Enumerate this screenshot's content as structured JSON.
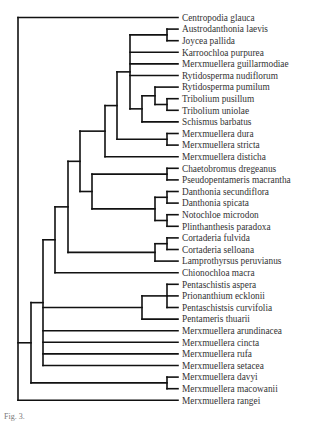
{
  "figure": {
    "type": "phylogenetic-tree",
    "caption_fragment": "Fig. 3.",
    "leaves": [
      "Centropodia glauca",
      "Austrodanthonia laevis",
      "Joycea pallida",
      "Karroochloa purpurea",
      "Merxmuellera guillarmodiae",
      "Rytidosperma nudiflorum",
      "Rytidosperma pumilum",
      "Tribolium pusillum",
      "Tribolium uniolae",
      "Schismus barbatus",
      "Merxmuellera dura",
      "Merxmuellera stricta",
      "Merxmuellera disticha",
      "Chaetobromus dregeanus",
      "Pseudopentameris macrantha",
      "Danthonia secundiflora",
      "Danthonia spicata",
      "Notochloe microdon",
      "Plinthanthesis paradoxa",
      "Cortaderia fulvida",
      "Cortaderia selloana",
      "Lamprothyrsus peruvianus",
      "Chionochloa macra",
      "Pentaschistis aspera",
      "Prionanthium ecklonii",
      "Pentaschistsis curvifolia",
      "Pentameris thuarii",
      "Merxmuellera arundinacea",
      "Merxmuellera cincta",
      "Merxmuellera rufa",
      "Merxmuellera setacea",
      "Merxmuellera davyi",
      "Merxmuellera macowanii",
      "Merxmuellera rangei"
    ],
    "tree": {
      "x": 18,
      "c": [
        0,
        {
          "x": 31,
          "c": [
            {
              "x": 43,
              "c": [
                {
                  "x": 55,
                  "c": [
                    {
                      "x": 68,
                      "c": [
                        {
                          "x": 80,
                          "c": [
                            {
                              "x": 105,
                              "c": [
                                {
                                  "x": 117,
                                  "c": [
                                    {
                                      "x": 130,
                                      "c": [
                                        {
                                          "x": 167,
                                          "c": [
                                            1,
                                            2
                                          ]
                                        },
                                        3,
                                        4,
                                        5,
                                        {
                                          "x": 142,
                                          "c": [
                                            {
                                              "x": 155,
                                              "c": [
                                                6,
                                                {
                                                  "x": 167,
                                                  "c": [
                                                    7,
                                                    8
                                                  ]
                                                }
                                              ]
                                            },
                                            9
                                          ]
                                        }
                                      ]
                                    },
                                    {
                                      "x": 167,
                                      "c": [
                                        10,
                                        11
                                      ]
                                    }
                                  ]
                                },
                                12
                              ]
                            },
                            {
                              "x": 92,
                              "c": [
                                {
                                  "x": 167,
                                  "c": [
                                    13,
                                    14
                                  ]
                                },
                                {
                                  "x": 155,
                                  "c": [
                                    {
                                      "x": 167,
                                      "c": [
                                        15,
                                        16
                                      ]
                                    },
                                    {
                                      "x": 167,
                                      "c": [
                                        17,
                                        18
                                      ]
                                    }
                                  ]
                                }
                              ]
                            }
                          ]
                        },
                        {
                          "x": 155,
                          "c": [
                            {
                              "x": 167,
                              "c": [
                                19,
                                20
                              ]
                            },
                            21
                          ]
                        }
                      ]
                    },
                    22
                  ]
                },
                {
                  "x": 142,
                  "c": [
                    {
                      "x": 167,
                      "c": [
                        23,
                        24,
                        25
                      ]
                    },
                    26
                  ]
                },
                27,
                28,
                29,
                30
              ]
            },
            {
              "x": 167,
              "c": [
                31,
                32
              ]
            }
          ]
        },
        33
      ]
    }
  },
  "layout": {
    "leaf_top_y": 17.5,
    "leaf_step": 11.6,
    "tip_x": 178,
    "label_x": 182,
    "line_color": "#111111",
    "label_color": "#333333"
  }
}
